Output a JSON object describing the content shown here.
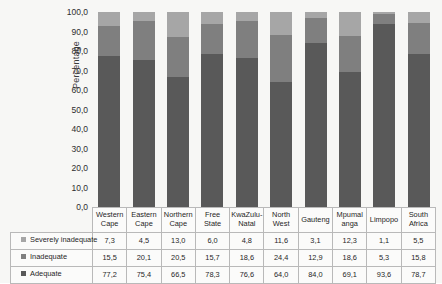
{
  "chart_data": {
    "type": "bar",
    "subtype": "stacked-100-percent",
    "title": "",
    "xlabel": "",
    "ylabel": "Percentage",
    "ylim": [
      0,
      100
    ],
    "ytick_step": 10,
    "grid": false,
    "legend_position": "table-left",
    "categories": [
      "Western Cape",
      "Eastern Cape",
      "Northern Cape",
      "Free State",
      "KwaZulu-Natal",
      "North West",
      "Gauteng",
      "Mpumalanga",
      "Limpopo",
      "South Africa"
    ],
    "category_lines": [
      [
        "Western",
        "Cape"
      ],
      [
        "Eastern",
        "Cape"
      ],
      [
        "Northern",
        "Cape"
      ],
      [
        "Free",
        "State"
      ],
      [
        "KwaZulu-",
        "Natal"
      ],
      [
        "North",
        "West"
      ],
      [
        "Gauteng"
      ],
      [
        "Mpumal",
        "anga"
      ],
      [
        "Limpopo"
      ],
      [
        "South",
        "Africa"
      ]
    ],
    "ytick_labels": [
      "100,0",
      "90,0",
      "80,0",
      "70,0",
      "60,0",
      "50,0",
      "40,0",
      "30,0",
      "20,0",
      "10,0",
      "0,0"
    ],
    "ytick_values": [
      100,
      90,
      80,
      70,
      60,
      50,
      40,
      30,
      20,
      10,
      0
    ],
    "series": [
      {
        "name": "Severely inadequate",
        "color": "#a6a6a6",
        "stack_order": 3,
        "values": [
          7.3,
          4.5,
          13.0,
          6.0,
          4.8,
          11.6,
          3.1,
          12.3,
          1.1,
          5.5
        ],
        "labels": [
          "7,3",
          "4,5",
          "13,0",
          "6,0",
          "4,8",
          "11,6",
          "3,1",
          "12,3",
          "1,1",
          "5,5"
        ]
      },
      {
        "name": "Inadequate",
        "color": "#7f7f7f",
        "stack_order": 2,
        "values": [
          15.5,
          20.1,
          20.5,
          15.7,
          18.6,
          24.4,
          12.9,
          18.6,
          5.3,
          15.8
        ],
        "labels": [
          "15,5",
          "20,1",
          "20,5",
          "15,7",
          "18,6",
          "24,4",
          "12,9",
          "18,6",
          "5,3",
          "15,8"
        ]
      },
      {
        "name": "Adequate",
        "color": "#595959",
        "stack_order": 1,
        "values": [
          77.2,
          75.4,
          66.5,
          78.3,
          76.6,
          64.0,
          84.0,
          69.1,
          93.6,
          78.7
        ],
        "labels": [
          "77,2",
          "75,4",
          "66,5",
          "78,3",
          "76,6",
          "64,0",
          "84,0",
          "69,1",
          "93,6",
          "78,7"
        ]
      }
    ]
  },
  "axis": {
    "y_title": "Percentage"
  }
}
